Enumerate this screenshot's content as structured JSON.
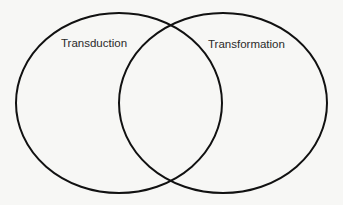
{
  "diagram": {
    "type": "venn",
    "sets": [
      {
        "label": "Transduction"
      },
      {
        "label": "Transformation"
      }
    ],
    "stroke_color": "#111111"
  }
}
